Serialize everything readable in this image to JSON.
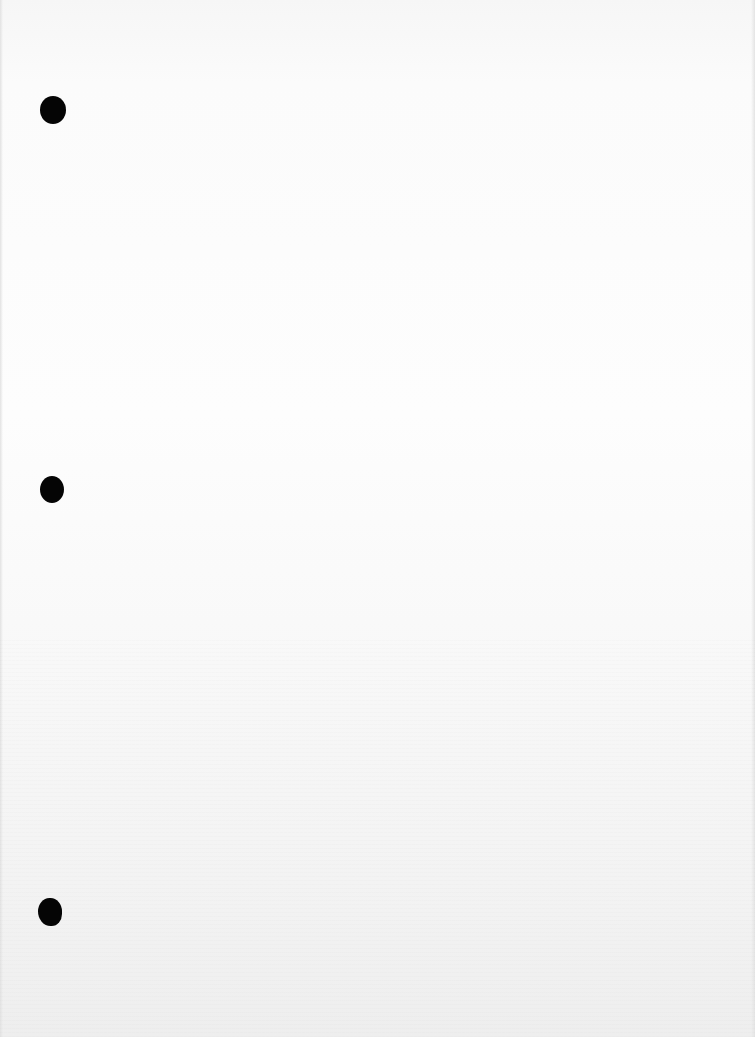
{
  "page": {
    "type": "blank scanned sheet",
    "background_color": "#fcfcfc",
    "punch_holes": [
      {
        "name": "punch-hole-top",
        "x": 53,
        "y": 110,
        "w": 26,
        "h": 28
      },
      {
        "name": "punch-hole-middle",
        "x": 52,
        "y": 490,
        "w": 24,
        "h": 27
      },
      {
        "name": "punch-hole-bottom",
        "x": 50,
        "y": 912,
        "w": 24,
        "h": 28
      }
    ],
    "hole_color": "#050505"
  }
}
